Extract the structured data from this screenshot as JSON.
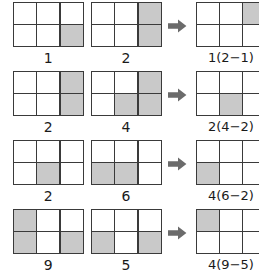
{
  "diagram": {
    "grid": {
      "columns": 3,
      "rows": 2
    },
    "colors": {
      "shaded": "#c9c9c9",
      "empty": "#ffffff",
      "stroke": "#3a3a3a",
      "text": "#1a1a1a",
      "arrow": "#6b6b6b"
    },
    "arrow_icon": "right-arrow-icon",
    "rows": [
      {
        "operand1": {
          "label": "1",
          "cells": [
            0,
            0,
            0,
            0,
            0,
            1
          ]
        },
        "operand2": {
          "label": "2",
          "cells": [
            0,
            0,
            1,
            0,
            0,
            1
          ]
        },
        "result": {
          "label": "1(2−1)",
          "cells": [
            0,
            0,
            1,
            0,
            0,
            0
          ]
        }
      },
      {
        "operand1": {
          "label": "2",
          "cells": [
            0,
            0,
            1,
            0,
            0,
            1
          ]
        },
        "operand2": {
          "label": "4",
          "cells": [
            0,
            0,
            1,
            0,
            1,
            1
          ]
        },
        "result": {
          "label": "2(4−2)",
          "cells": [
            0,
            0,
            0,
            0,
            1,
            0
          ]
        }
      },
      {
        "operand1": {
          "label": "2",
          "cells": [
            0,
            0,
            0,
            0,
            1,
            0
          ]
        },
        "operand2": {
          "label": "6",
          "cells": [
            0,
            0,
            0,
            1,
            1,
            0
          ]
        },
        "result": {
          "label": "4(6−2)",
          "cells": [
            0,
            0,
            0,
            1,
            0,
            0
          ]
        }
      },
      {
        "operand1": {
          "label": "9",
          "cells": [
            1,
            0,
            0,
            1,
            0,
            1
          ]
        },
        "operand2": {
          "label": "5",
          "cells": [
            0,
            0,
            0,
            1,
            0,
            1
          ]
        },
        "result": {
          "label": "4(9−5)",
          "cells": [
            1,
            0,
            0,
            0,
            0,
            0
          ]
        }
      }
    ]
  }
}
